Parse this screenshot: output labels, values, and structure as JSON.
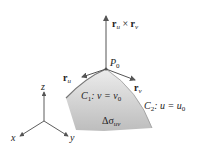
{
  "diagram": {
    "normal_label": {
      "r1": "r",
      "s1": "u",
      "op": " × ",
      "r2": "r",
      "s2": "v"
    },
    "point_label": {
      "main": "P",
      "sub": "0"
    },
    "ru_label": {
      "main": "r",
      "sub": "u"
    },
    "rv_label": {
      "main": "r",
      "sub": "v"
    },
    "c1_label": {
      "main": "C",
      "sub": "1",
      "rest": ": v = v",
      "sub2": "0"
    },
    "c2_label": {
      "main": "C",
      "sub": "2",
      "rest": ": u = u",
      "sub2": "0"
    },
    "area_label": {
      "main": "Δσ",
      "sub": "uv"
    },
    "axes": {
      "x": "x",
      "y": "y",
      "z": "z"
    },
    "colors": {
      "surface_top": "#e8e8e8",
      "surface_bottom": "#b8b8b8",
      "edge": "#7a7a7a",
      "arrow": "#555555"
    }
  }
}
